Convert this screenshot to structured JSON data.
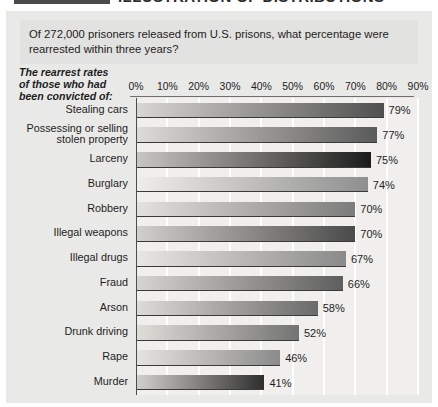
{
  "header": {
    "title": "ILLUSTRATION OF DISTRIBUTIONS"
  },
  "question": {
    "text": "Of 272,000 prisoners released from U.S. prisons, what percentage were rearrested within three years?"
  },
  "caption": {
    "line1": "The rearrest rates",
    "line2": "of those who had",
    "line3": "been convicted of:"
  },
  "chart_data": {
    "type": "bar",
    "orientation": "horizontal",
    "title": "",
    "subtitle": "",
    "xlabel": "",
    "ylabel": "",
    "xlim": [
      0,
      90
    ],
    "grid": true,
    "legend": "none",
    "tick_labels": [
      "0%",
      "10%",
      "20%",
      "30%",
      "40%",
      "50%",
      "60%",
      "70%",
      "80%",
      "90%"
    ],
    "tick_values": [
      0,
      10,
      20,
      30,
      40,
      50,
      60,
      70,
      80,
      90
    ],
    "categories": [
      "Stealing cars",
      "Possessing or selling stolen property",
      "Larceny",
      "Burglary",
      "Robbery",
      "Illegal weapons",
      "Illegal drugs",
      "Fraud",
      "Arson",
      "Drunk driving",
      "Rape",
      "Murder"
    ],
    "values": [
      79,
      77,
      75,
      74,
      70,
      70,
      67,
      66,
      58,
      52,
      46,
      41
    ],
    "value_labels": [
      "79%",
      "77%",
      "75%",
      "74%",
      "70%",
      "70%",
      "67%",
      "66%",
      "58%",
      "52%",
      "46%",
      "41%"
    ],
    "bars": [
      {
        "label": "Stealing cars",
        "label_lines": [
          "Stealing cars"
        ],
        "value": 79,
        "value_label": "79%",
        "color_start": "#d8d7d3",
        "color_end": "#4f4f4f"
      },
      {
        "label": "Possessing or selling stolen property",
        "label_lines": [
          "Possessing or selling",
          "stolen property"
        ],
        "value": 77,
        "value_label": "77%",
        "color_start": "#dedcd8",
        "color_end": "#5a5a5a"
      },
      {
        "label": "Larceny",
        "label_lines": [
          "Larceny"
        ],
        "value": 75,
        "value_label": "75%",
        "color_start": "#c9c7c3",
        "color_end": "#1b1b1b"
      },
      {
        "label": "Burglary",
        "label_lines": [
          "Burglary"
        ],
        "value": 74,
        "value_label": "74%",
        "color_start": "#efeeeb",
        "color_end": "#8f8f8f"
      },
      {
        "label": "Robbery",
        "label_lines": [
          "Robbery"
        ],
        "value": 70,
        "value_label": "70%",
        "color_start": "#e4e2de",
        "color_end": "#7c7c7c"
      },
      {
        "label": "Illegal weapons",
        "label_lines": [
          "Illegal weapons"
        ],
        "value": 70,
        "value_label": "70%",
        "color_start": "#d2d0cc",
        "color_end": "#4a4a4a"
      },
      {
        "label": "Illegal drugs",
        "label_lines": [
          "Illegal drugs"
        ],
        "value": 67,
        "value_label": "67%",
        "color_start": "#e9e7e3",
        "color_end": "#8a8a8a"
      },
      {
        "label": "Fraud",
        "label_lines": [
          "Fraud"
        ],
        "value": 66,
        "value_label": "66%",
        "color_start": "#d7d5d1",
        "color_end": "#5e5e5e"
      },
      {
        "label": "Arson",
        "label_lines": [
          "Arson"
        ],
        "value": 58,
        "value_label": "58%",
        "color_start": "#dedcd8",
        "color_end": "#6a6a6a"
      },
      {
        "label": "Drunk driving",
        "label_lines": [
          "Drunk driving"
        ],
        "value": 52,
        "value_label": "52%",
        "color_start": "#e0ded9",
        "color_end": "#737373"
      },
      {
        "label": "Rape",
        "label_lines": [
          "Rape"
        ],
        "value": 46,
        "value_label": "46%",
        "color_start": "#e6e4e0",
        "color_end": "#8b8b8b"
      },
      {
        "label": "Murder",
        "label_lines": [
          "Murder"
        ],
        "value": 41,
        "value_label": "41%",
        "color_start": "#d3d1cd",
        "color_end": "#2e2e2e"
      }
    ]
  },
  "colors": {
    "page_background": "#e9e9e7",
    "plot_background": "#f0efed",
    "gridline": "#ffffff",
    "axis": "#4d4d4d",
    "text": "#1d1d1d"
  }
}
